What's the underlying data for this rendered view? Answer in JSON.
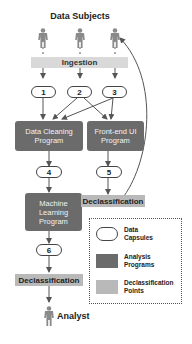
{
  "diagram": {
    "title": "Data Subjects",
    "ingestion_label": "Ingestion",
    "capsules": [
      {
        "id": "c1",
        "label": "1"
      },
      {
        "id": "c2",
        "label": "2"
      },
      {
        "id": "c3",
        "label": "3"
      },
      {
        "id": "c4",
        "label": "4"
      },
      {
        "id": "c5",
        "label": "5"
      },
      {
        "id": "c6",
        "label": "6"
      }
    ],
    "programs": {
      "data_cleaning": {
        "line1": "Data Cleaning",
        "line2": "Program"
      },
      "frontend_ui": {
        "line1": "Front-end UI",
        "line2": "Program"
      },
      "machine_learning": {
        "line1": "Machine",
        "line2": "Learning",
        "line3": "Program"
      }
    },
    "declassification_right": "Declassification",
    "declassification_left": "Declassification",
    "analyst_label": "Analyst",
    "edges": [
      "Data Subjects -> Ingestion",
      "Ingestion -> 1",
      "Ingestion -> 2",
      "Ingestion -> 3",
      "1 -> Data Cleaning Program",
      "2 -> Data Cleaning Program",
      "3 -> Data Cleaning Program",
      "2 -> Front-end UI Program",
      "3 -> Front-end UI Program",
      "Data Cleaning Program -> 4",
      "4 -> Machine Learning Program",
      "Machine Learning Program -> 6",
      "6 -> Declassification",
      "Declassification -> Analyst",
      "Front-end UI Program -> 5",
      "5 -> Declassification",
      "Declassification -> Data Subjects"
    ]
  },
  "legend": {
    "items": [
      {
        "kind": "capsule",
        "line1": "Data",
        "line2": "Capsules"
      },
      {
        "kind": "program",
        "line1": "Analysis",
        "line2": "Programs"
      },
      {
        "kind": "declass",
        "line1": "Declassification",
        "line2": "Points"
      }
    ]
  },
  "colors": {
    "program_fill": "#6b6b6b",
    "declass_fill": "#b9b9b9",
    "ingestion_fill": "#d9d9d9",
    "line": "#555555"
  }
}
